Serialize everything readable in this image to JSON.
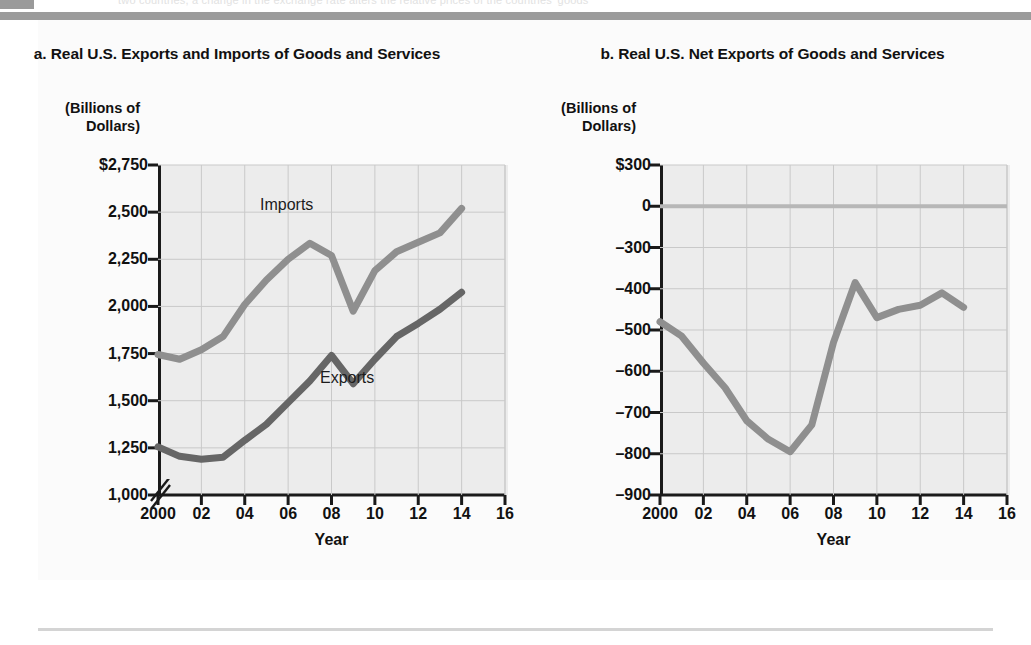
{
  "page": {
    "running_head": "two countries, a change in the exchange rate alters the relative prices of the countries' goods",
    "figure_tab": ""
  },
  "charts": [
    {
      "id": "a",
      "title": "a. Real U.S. Exports and Imports\nof Goods and Services",
      "axis_unit": "(Billions of\nDollars)",
      "xlabel": "Year",
      "series_labels": {
        "imports": "Imports",
        "exports": "Exports"
      },
      "colors": {
        "imports": "#8f8f8f",
        "exports": "#666666",
        "plot_bg": "#ececec",
        "grid": "#c9c9c9",
        "axis": "#1a1a1a"
      },
      "has_axis_break": true,
      "ytick_labels": [
        "$2,750",
        "2,500",
        "2,250",
        "2,000",
        "1,750",
        "1,500",
        "1,250",
        "1,000"
      ],
      "xtick_labels": [
        "2000",
        "02",
        "04",
        "06",
        "08",
        "10",
        "12",
        "14",
        "16"
      ]
    },
    {
      "id": "b",
      "title": "b. Real U.S. Net Exports of\nGoods and Services",
      "axis_unit": "(Billions of\nDollars)",
      "xlabel": "Year",
      "colors": {
        "net": "#8f8f8f",
        "plot_bg": "#ececec",
        "grid": "#c9c9c9",
        "axis": "#1a1a1a"
      },
      "has_axis_break": false,
      "ytick_labels": [
        "$300",
        "0",
        "–300",
        "–400",
        "–500",
        "–600",
        "–700",
        "–800",
        "–900"
      ],
      "xtick_labels": [
        "2000",
        "02",
        "04",
        "06",
        "08",
        "10",
        "12",
        "14",
        "16"
      ]
    }
  ],
  "chart_data": [
    {
      "type": "line",
      "id": "a",
      "title": "a. Real U.S. Exports and Imports of Goods and Services",
      "xlabel": "Year",
      "ylabel": "(Billions of Dollars)",
      "xlim": [
        2000,
        2016
      ],
      "ylim": [
        950,
        2750
      ],
      "yticks": [
        1000,
        1250,
        1500,
        1750,
        2000,
        2250,
        2500,
        2750
      ],
      "ytick_labels": [
        "1,000",
        "1,250",
        "1,500",
        "1,750",
        "2,000",
        "2,250",
        "2,500",
        "$2,750"
      ],
      "xticks": [
        2000,
        2002,
        2004,
        2006,
        2008,
        2010,
        2012,
        2014,
        2016
      ],
      "xtick_labels": [
        "2000",
        "02",
        "04",
        "06",
        "08",
        "10",
        "12",
        "14",
        "16"
      ],
      "grid": true,
      "axis_break_below": 1000,
      "legend": "inline-labels",
      "x": [
        2000,
        2001,
        2002,
        2003,
        2004,
        2005,
        2006,
        2007,
        2008,
        2009,
        2010,
        2011,
        2012,
        2013,
        2014
      ],
      "series": [
        {
          "name": "Imports",
          "color": "#8f8f8f",
          "values": [
            1745,
            1720,
            1770,
            1840,
            2010,
            2140,
            2250,
            2335,
            2270,
            1975,
            2190,
            2290,
            2340,
            2390,
            2520
          ]
        },
        {
          "name": "Exports",
          "color": "#666666",
          "values": [
            1255,
            1205,
            1190,
            1200,
            1290,
            1375,
            1490,
            1605,
            1740,
            1590,
            1720,
            1840,
            1910,
            1985,
            2075
          ]
        }
      ]
    },
    {
      "type": "line",
      "id": "b",
      "title": "b. Real U.S. Net Exports of Goods and Services",
      "xlabel": "Year",
      "ylabel": "(Billions of Dollars)",
      "xlim": [
        2000,
        2016
      ],
      "ylim": [
        -900,
        300
      ],
      "yticks": [
        300,
        0,
        -300,
        -400,
        -500,
        -600,
        -700,
        -800,
        -900
      ],
      "ytick_labels": [
        "$300",
        "0",
        "–300",
        "–400",
        "–500",
        "–600",
        "–700",
        "–800",
        "–900"
      ],
      "yaxis_nonuniform": true,
      "xticks": [
        2000,
        2002,
        2004,
        2006,
        2008,
        2010,
        2012,
        2014,
        2016
      ],
      "xtick_labels": [
        "2000",
        "02",
        "04",
        "06",
        "08",
        "10",
        "12",
        "14",
        "16"
      ],
      "grid": true,
      "zero_line": 0,
      "x": [
        2000,
        2001,
        2002,
        2003,
        2004,
        2005,
        2006,
        2007,
        2008,
        2009,
        2010,
        2011,
        2012,
        2013,
        2014
      ],
      "series": [
        {
          "name": "Net Exports",
          "color": "#8f8f8f",
          "values": [
            -480,
            -515,
            -580,
            -640,
            -720,
            -765,
            -795,
            -730,
            -530,
            -385,
            -470,
            -450,
            -440,
            -410,
            -445
          ]
        }
      ]
    }
  ]
}
